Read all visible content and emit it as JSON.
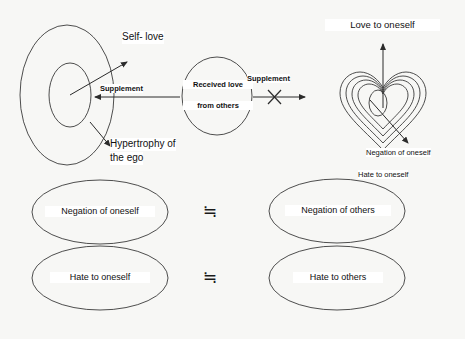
{
  "diagram": {
    "background_color": "#f7f7f5",
    "stroke_color": "#3a3a3a",
    "text_color": "#111111"
  },
  "top_row": {
    "left_shape": {
      "name": "concentric-ellipse",
      "outer_label": "Hypertrophy of\nthe ego",
      "outer_label_line1": "Hypertrophy of",
      "outer_label_line2": "the ego",
      "inner_label": "Self- love"
    },
    "center_shape": {
      "name": "received-love-circle",
      "line1": "Received love",
      "line2": "from others"
    },
    "right_shape": {
      "name": "nested-heart",
      "rings": 4,
      "top_label": "Love to oneself",
      "diagonal_label": "Negation of oneself",
      "below_label": "Hate to oneself"
    },
    "arrows": {
      "left_arrow_label": "Supplement",
      "right_arrow_label": "Supplement",
      "right_arrow_crossed_out": true
    }
  },
  "bottom_rows": [
    {
      "left_label": "Negation of oneself",
      "relation": "≒",
      "right_label": "Negation of others"
    },
    {
      "left_label": "Hate to oneself",
      "relation": "≒",
      "right_label": "Hate to others"
    }
  ]
}
